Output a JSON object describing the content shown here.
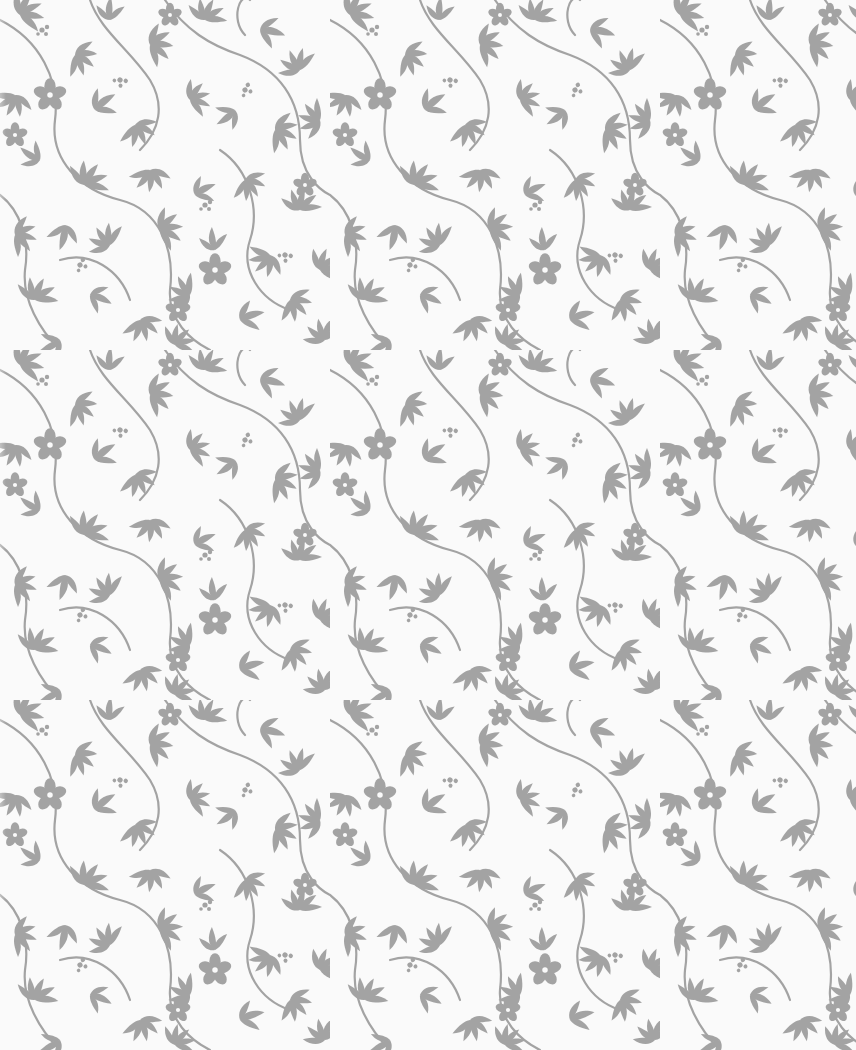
{
  "image": {
    "description": "Seamless floral wallpaper pattern of grey leaves, curling vines and small five-petal flowers on a white background",
    "width": 856,
    "height": 1050
  },
  "pattern": {
    "motifs": [
      "leaf-sprig",
      "vine",
      "five-petal-flower",
      "small-bud-cluster"
    ],
    "tile_width": 330,
    "tile_height": 350,
    "repeat": "half-drop"
  },
  "colors": {
    "background": "#fafafa",
    "foreground": "#a3a3a3"
  }
}
